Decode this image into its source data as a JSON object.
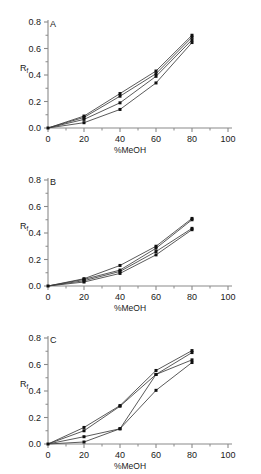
{
  "figure": {
    "panels": [
      "A",
      "B",
      "C"
    ],
    "background": "#ffffff",
    "line_color": "#3c3c3c",
    "marker_color": "#101010",
    "axis_color": "#8a8a8a"
  },
  "labels": {
    "panel_a": "A",
    "panel_b": "B",
    "panel_c": "C",
    "xlabel": "%MeOH",
    "ylabel_main": "R",
    "ylabel_sub": "f",
    "x_ticks": [
      "0",
      "20",
      "40",
      "60",
      "80",
      "100"
    ],
    "y_ticks": [
      "0.0",
      "0.2",
      "0.4",
      "0.6",
      "0.8"
    ]
  },
  "chart_data": [
    {
      "type": "line",
      "title": "A",
      "xlabel": "%MeOH",
      "ylabel": "Rf",
      "xlim": [
        0,
        100
      ],
      "ylim": [
        0.0,
        0.8
      ],
      "x_ticks": [
        0,
        20,
        40,
        60,
        80,
        100
      ],
      "y_ticks": [
        0.0,
        0.2,
        0.4,
        0.6,
        0.8
      ],
      "grid": false,
      "legend": "none",
      "markers": "filled-square",
      "x": [
        0,
        20,
        40,
        60,
        80
      ],
      "series": [
        {
          "name": "series-1",
          "values": [
            0.0,
            0.09,
            0.26,
            0.43,
            0.7
          ]
        },
        {
          "name": "series-2",
          "values": [
            0.0,
            0.08,
            0.24,
            0.41,
            0.685
          ]
        },
        {
          "name": "series-3",
          "values": [
            0.0,
            0.065,
            0.19,
            0.39,
            0.665
          ]
        },
        {
          "name": "series-4",
          "values": [
            0.0,
            0.04,
            0.14,
            0.34,
            0.645
          ]
        }
      ]
    },
    {
      "type": "line",
      "title": "B",
      "xlabel": "%MeOH",
      "ylabel": "Rf",
      "xlim": [
        0,
        100
      ],
      "ylim": [
        0.0,
        0.8
      ],
      "x_ticks": [
        0,
        20,
        40,
        60,
        80,
        100
      ],
      "y_ticks": [
        0.0,
        0.2,
        0.4,
        0.6,
        0.8
      ],
      "grid": false,
      "legend": "none",
      "markers": "filled-square",
      "x": [
        0,
        20,
        40,
        60,
        80
      ],
      "series": [
        {
          "name": "series-1",
          "values": [
            0.0,
            0.055,
            0.155,
            0.3,
            0.51
          ]
        },
        {
          "name": "series-2",
          "values": [
            0.0,
            0.05,
            0.12,
            0.285,
            0.5
          ]
        },
        {
          "name": "series-3",
          "values": [
            0.0,
            0.04,
            0.11,
            0.26,
            0.435
          ]
        },
        {
          "name": "series-4",
          "values": [
            0.0,
            0.03,
            0.095,
            0.235,
            0.425
          ]
        }
      ]
    },
    {
      "type": "line",
      "title": "C",
      "xlabel": "%MeOH",
      "ylabel": "Rf",
      "xlim": [
        0,
        100
      ],
      "ylim": [
        0.0,
        0.8
      ],
      "x_ticks": [
        0,
        20,
        40,
        60,
        80,
        100
      ],
      "y_ticks": [
        0.0,
        0.2,
        0.4,
        0.6,
        0.8
      ],
      "grid": false,
      "legend": "none",
      "markers": "filled-square",
      "x": [
        0,
        20,
        40,
        60,
        80
      ],
      "series": [
        {
          "name": "series-1",
          "values": [
            0.0,
            0.125,
            0.29,
            0.555,
            0.705
          ]
        },
        {
          "name": "series-2",
          "values": [
            0.0,
            0.1,
            0.285,
            0.525,
            0.69
          ]
        },
        {
          "name": "series-3",
          "values": [
            0.0,
            0.055,
            0.115,
            0.525,
            0.635
          ]
        },
        {
          "name": "series-4",
          "values": [
            0.0,
            0.015,
            0.115,
            0.405,
            0.615
          ]
        }
      ]
    }
  ]
}
